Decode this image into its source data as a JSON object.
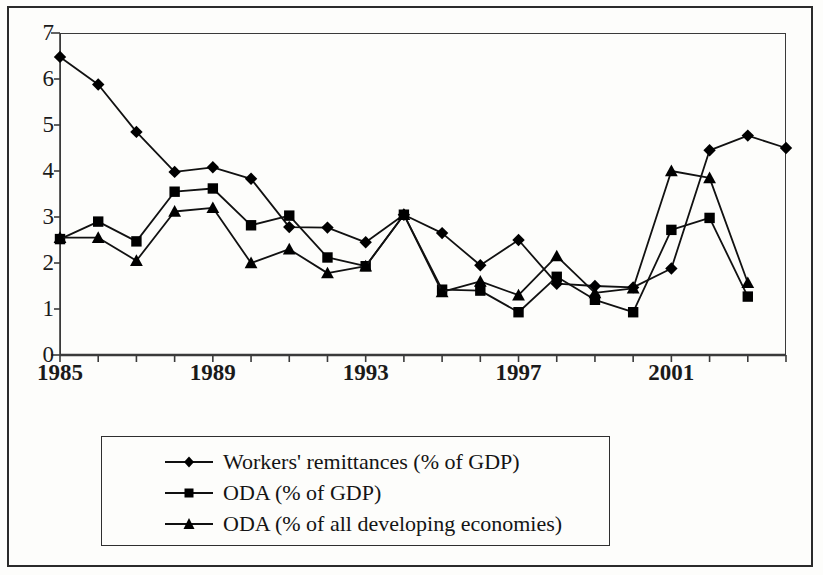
{
  "chart_data": {
    "type": "line",
    "title": "",
    "xlabel": "",
    "ylabel": "",
    "xlim": [
      1985,
      2004
    ],
    "ylim": [
      0,
      7
    ],
    "y_ticks": [
      0,
      1,
      2,
      3,
      4,
      5,
      6,
      7
    ],
    "y_tick_labels": [
      "0",
      "1",
      "2",
      "3",
      "4",
      "5",
      "6",
      "7"
    ],
    "x": [
      1985,
      1986,
      1987,
      1988,
      1989,
      1990,
      1991,
      1992,
      1993,
      1994,
      1995,
      1996,
      1997,
      1998,
      1999,
      2000,
      2001,
      2002,
      2003,
      2004
    ],
    "x_tick_labels": [
      "1985",
      "1989",
      "1993",
      "1997",
      "2001"
    ],
    "x_labeled_years": [
      1985,
      1989,
      1993,
      1997,
      2001
    ],
    "x_minor_ticks_every": 1,
    "grid": false,
    "legend_position": "below-center",
    "series": [
      {
        "name": "Workers' remittances (% of GDP)",
        "marker": "diamond",
        "values": [
          6.48,
          5.88,
          4.85,
          3.98,
          4.08,
          3.83,
          2.78,
          2.77,
          2.45,
          3.05,
          2.65,
          1.95,
          2.5,
          1.55,
          1.5,
          1.47,
          1.88,
          4.45,
          4.77,
          4.5
        ]
      },
      {
        "name": "ODA (% of GDP)",
        "marker": "square",
        "values": [
          2.52,
          2.9,
          2.47,
          3.55,
          3.62,
          2.82,
          3.03,
          2.12,
          1.93,
          3.05,
          1.42,
          1.4,
          0.93,
          1.7,
          1.2,
          0.93,
          2.72,
          2.98,
          1.27,
          null
        ]
      },
      {
        "name": "ODA (% of all developing economies)",
        "marker": "triangle",
        "values": [
          2.55,
          2.55,
          2.05,
          3.12,
          3.2,
          2.0,
          2.3,
          1.78,
          1.93,
          3.05,
          1.37,
          1.6,
          1.3,
          2.15,
          1.35,
          1.45,
          4.0,
          3.85,
          1.57,
          null
        ]
      }
    ]
  },
  "legend": {
    "items": [
      {
        "label": "Workers' remittances (% of GDP)",
        "marker": "diamond"
      },
      {
        "label": "ODA (% of GDP)",
        "marker": "square"
      },
      {
        "label": "ODA (% of all developing economies)",
        "marker": "triangle"
      }
    ]
  },
  "colors": {
    "line": "#111111",
    "marker": "#000000",
    "axis": "#3a3a3a",
    "frame": "#2b2b2b",
    "background": "#fdfdfb"
  }
}
